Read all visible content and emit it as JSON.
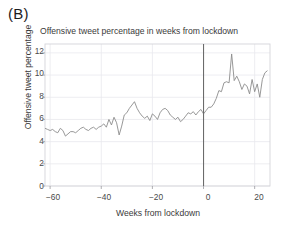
{
  "figure": {
    "panel_label": "(B)"
  },
  "chart_data": {
    "type": "line",
    "title": "Offensive tweet percentage in weeks from lockdown",
    "xlabel": "Weeks from lockdown",
    "ylabel": "Offensive tweet percentage",
    "xlim": [
      -62,
      26
    ],
    "ylim": [
      0,
      12.8
    ],
    "xticks": [
      -60,
      -40,
      -20,
      0,
      20
    ],
    "xtick_labels": [
      "−60",
      "−40",
      "−20",
      "0",
      "20"
    ],
    "yticks": [
      0,
      2,
      4,
      6,
      8,
      10,
      12
    ],
    "ytick_labels": [
      "0",
      "2",
      "4",
      "6",
      "8",
      "10",
      "12"
    ],
    "grid": true,
    "grid_color": "#e9e9ee",
    "line_color": "#8c8c8c",
    "line_width": 0.9,
    "vline": {
      "x": 0,
      "color": "#6b6b6b",
      "width": 1.1,
      "label": "lockdown"
    },
    "legend": null,
    "series": [
      {
        "name": "Offensive tweet percentage",
        "x": [
          -62,
          -61,
          -60,
          -59,
          -58,
          -57,
          -56,
          -55,
          -54,
          -53,
          -52,
          -51,
          -50,
          -49,
          -48,
          -47,
          -46,
          -45,
          -44,
          -43,
          -42,
          -41,
          -40,
          -39,
          -38,
          -37,
          -36,
          -35,
          -34,
          -33,
          -32,
          -31,
          -30,
          -29,
          -28,
          -27,
          -26,
          -25,
          -24,
          -23,
          -22,
          -21,
          -20,
          -19,
          -18,
          -17,
          -16,
          -15,
          -14,
          -13,
          -12,
          -11,
          -10,
          -9,
          -8,
          -7,
          -6,
          -5,
          -4,
          -3,
          -2,
          -1,
          0,
          1,
          2,
          3,
          4,
          5,
          6,
          7,
          8,
          9,
          10,
          11,
          12,
          13,
          14,
          15,
          16,
          17,
          18,
          19,
          20,
          21,
          22,
          23,
          24,
          25
        ],
        "y": [
          5.2,
          5.1,
          5.0,
          5.1,
          4.9,
          4.8,
          5.2,
          5.0,
          4.5,
          4.7,
          4.9,
          4.9,
          4.8,
          5.0,
          5.2,
          5.3,
          5.1,
          5.0,
          5.2,
          5.3,
          5.1,
          5.3,
          5.4,
          5.6,
          5.3,
          6.0,
          5.5,
          6.2,
          5.7,
          4.6,
          5.4,
          6.4,
          6.6,
          7.0,
          7.3,
          7.6,
          7.0,
          6.6,
          6.3,
          6.1,
          6.3,
          5.9,
          6.5,
          6.3,
          6.0,
          6.6,
          6.9,
          7.0,
          6.8,
          6.4,
          6.2,
          6.0,
          6.2,
          5.8,
          6.0,
          6.3,
          6.6,
          6.5,
          6.7,
          6.4,
          6.7,
          6.9,
          6.5,
          6.8,
          7.1,
          7.1,
          7.4,
          7.9,
          8.6,
          8.5,
          9.3,
          9.4,
          9.3,
          11.9,
          9.5,
          9.9,
          9.4,
          8.7,
          9.2,
          9.0,
          8.3,
          9.6,
          8.5,
          9.2,
          8.0,
          9.6,
          10.2,
          10.4
        ]
      }
    ]
  }
}
